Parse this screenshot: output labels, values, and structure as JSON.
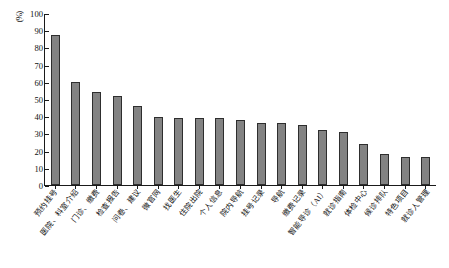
{
  "chart_data": {
    "type": "bar",
    "title": "",
    "xlabel": "",
    "ylabel": "(%)",
    "ylim": [
      0,
      100
    ],
    "yticks": [
      0,
      10,
      20,
      30,
      40,
      50,
      60,
      70,
      80,
      90,
      100
    ],
    "grid": false,
    "legend": null,
    "bar_color": "#838383",
    "bar_edge_color": "#2e2e2e",
    "background": "#ffffff",
    "categories": [
      "预约挂号",
      "医院、科室介绍",
      "门诊、缴费",
      "检查报告",
      "问卷、建议",
      "微官网",
      "找医生",
      "住院出院",
      "个人信息",
      "院内导航",
      "挂号记录",
      "导航",
      "缴费记录",
      "智能导诊（AI）",
      "就诊指南",
      "体检中心",
      "候诊排队",
      "特色项目",
      "就诊人管理"
    ],
    "values": [
      87,
      60,
      54,
      52,
      46,
      39.5,
      39,
      39,
      39,
      38,
      36,
      36,
      35,
      32,
      31,
      24,
      18,
      16,
      16
    ]
  }
}
